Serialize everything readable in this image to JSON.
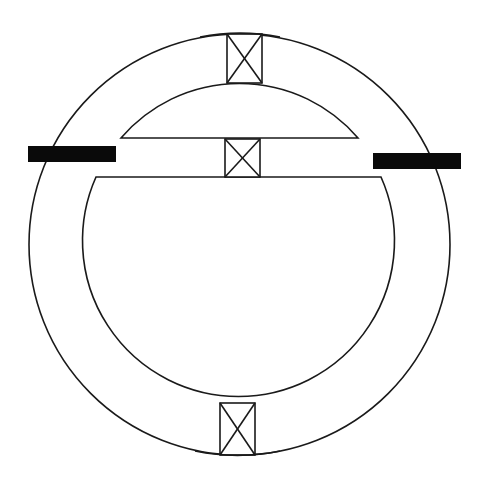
{
  "diagram": {
    "type": "schematic",
    "outer_circle": {
      "cx": 239.5,
      "cy": 244.5,
      "r": 210.5
    },
    "inner_circle": {
      "cx": 239,
      "cy": 243,
      "r": 156
    },
    "upper_lens": {
      "chord_y": 138,
      "x1": 121,
      "x2": 358
    },
    "lower_segment": {
      "chord_y": 177,
      "x1": 96,
      "x2": 381
    },
    "cross_boxes": [
      {
        "name": "top",
        "x": 227,
        "y": 34,
        "w": 35,
        "h": 49
      },
      {
        "name": "middle",
        "x": 225,
        "y": 139,
        "w": 35,
        "h": 38
      },
      {
        "name": "bottom",
        "x": 220,
        "y": 403,
        "w": 35,
        "h": 52
      }
    ],
    "labels": [
      {
        "name": "left",
        "text": "",
        "redacted": true
      },
      {
        "name": "right",
        "text": "",
        "redacted": true
      }
    ],
    "colors": {
      "stroke": "#1a1a1a",
      "background": "#ffffff",
      "label_fill": "#0a0a0a"
    }
  }
}
